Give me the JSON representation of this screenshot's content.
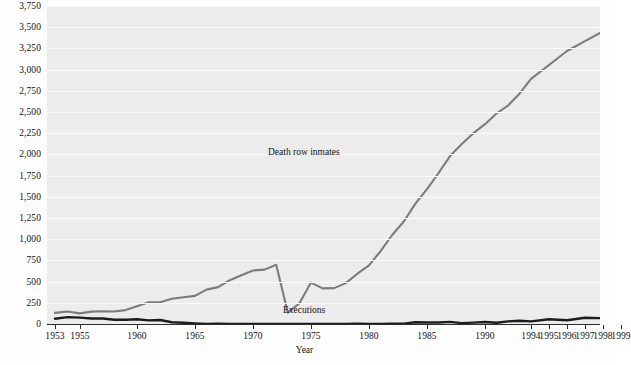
{
  "chart_data": {
    "type": "line",
    "title": "",
    "xlabel": "Year",
    "ylabel": "",
    "ylim": [
      0,
      3750
    ],
    "ytick_step": 250,
    "grid": "horizontal",
    "legend": "inline-annotation",
    "ytick_labels": [
      "0",
      "250",
      "500",
      "750",
      "1,000",
      "1,250",
      "1,500",
      "1,750",
      "2,000",
      "2,250",
      "2,500",
      "2,750",
      "3,000",
      "3,250",
      "3,500",
      "3,750"
    ],
    "xtick_labels": [
      "1953",
      "1955",
      "1960",
      "1965",
      "1970",
      "1975",
      "1980",
      "1985",
      "1990",
      "1994",
      "1995",
      "1996",
      "1997",
      "1998",
      "1999"
    ],
    "x": [
      1953,
      1954,
      1955,
      1956,
      1957,
      1958,
      1959,
      1960,
      1961,
      1962,
      1963,
      1964,
      1965,
      1966,
      1967,
      1968,
      1969,
      1970,
      1971,
      1972,
      1973,
      1974,
      1975,
      1976,
      1977,
      1978,
      1979,
      1980,
      1981,
      1982,
      1983,
      1984,
      1985,
      1986,
      1987,
      1988,
      1989,
      1990,
      1991,
      1992,
      1993,
      1994,
      1995,
      1996,
      1997,
      1998,
      1999
    ],
    "series": [
      {
        "name": "Death row inmates",
        "color": "#7c7c7c",
        "values": [
          131,
          147,
          125,
          146,
          151,
          147,
          164,
          210,
          257,
          257,
          297,
          315,
          331,
          406,
          435,
          517,
          575,
          631,
          642,
          698,
          134,
          244,
          488,
          420,
          423,
          482,
          593,
          691,
          860,
          1050,
          1209,
          1420,
          1591,
          1781,
          1984,
          2124,
          2250,
          2356,
          2482,
          2575,
          2716,
          2890,
          3054,
          3219,
          3335,
          3452,
          3527
        ]
      },
      {
        "name": "Executions",
        "color": "#1c1c1c",
        "values": [
          62,
          81,
          76,
          65,
          65,
          49,
          49,
          56,
          42,
          47,
          21,
          15,
          7,
          1,
          2,
          0,
          0,
          0,
          0,
          0,
          0,
          0,
          0,
          0,
          1,
          0,
          2,
          0,
          1,
          2,
          5,
          21,
          18,
          18,
          25,
          11,
          16,
          23,
          14,
          31,
          38,
          31,
          56,
          45,
          74,
          68,
          98
        ]
      }
    ]
  },
  "annotations": {
    "inmates_label": "Death row inmates",
    "executions_label": "Executions"
  },
  "axis": {
    "x_title": "Year"
  }
}
